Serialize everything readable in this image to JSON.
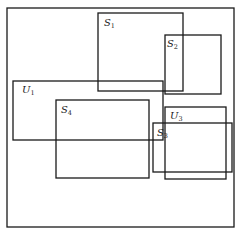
{
  "diagram": {
    "type": "set-rectangles",
    "sets": [
      {
        "id": "universe",
        "label": "",
        "sub": ""
      },
      {
        "id": "S1",
        "label": "S",
        "sub": "1"
      },
      {
        "id": "S2",
        "label": "S",
        "sub": "2"
      },
      {
        "id": "U1",
        "label": "U",
        "sub": "1"
      },
      {
        "id": "S4",
        "label": "S",
        "sub": "4"
      },
      {
        "id": "U3",
        "label": "U",
        "sub": "3"
      },
      {
        "id": "S3",
        "label": "S",
        "sub": "3"
      }
    ]
  }
}
